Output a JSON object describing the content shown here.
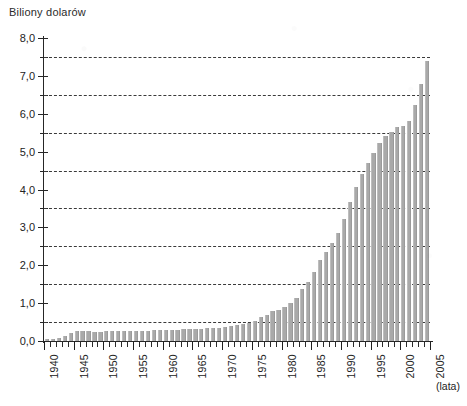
{
  "chart_data": {
    "type": "bar",
    "title": "",
    "ylabel": "Biliony dolarów",
    "xlabel": "(lata)",
    "ylim": [
      0.0,
      8.0
    ],
    "xlim": [
      1940,
      2005
    ],
    "grid": "horizontal dashed at half-unit values",
    "legend": "none",
    "bar_color": "#a9a9a9",
    "y_ticks_major": [
      "0,0",
      "1,0",
      "2,0",
      "3,0",
      "4,0",
      "5,0",
      "6,0",
      "7,0",
      "8,0"
    ],
    "y_tick_major_values": [
      0.0,
      1.0,
      2.0,
      3.0,
      4.0,
      5.0,
      6.0,
      7.0,
      8.0
    ],
    "y_tick_minor_values": [
      0.5,
      1.5,
      2.5,
      3.5,
      4.5,
      5.5,
      6.5,
      7.5
    ],
    "gridline_values": [
      0.5,
      1.5,
      2.5,
      3.5,
      4.5,
      5.5,
      6.5,
      7.5
    ],
    "x_ticks_major": [
      "1940",
      "1945",
      "1950",
      "1955",
      "1960",
      "1965",
      "1970",
      "1975",
      "1980",
      "1985",
      "1990",
      "1995",
      "2000",
      "2005"
    ],
    "x_tick_major_values": [
      1940,
      1945,
      1950,
      1955,
      1960,
      1965,
      1970,
      1975,
      1980,
      1985,
      1990,
      1995,
      2000,
      2005
    ],
    "categories": [
      1940,
      1941,
      1942,
      1943,
      1944,
      1945,
      1946,
      1947,
      1948,
      1949,
      1950,
      1951,
      1952,
      1953,
      1954,
      1955,
      1956,
      1957,
      1958,
      1959,
      1960,
      1961,
      1962,
      1963,
      1964,
      1965,
      1966,
      1967,
      1968,
      1969,
      1970,
      1971,
      1972,
      1973,
      1974,
      1975,
      1976,
      1977,
      1978,
      1979,
      1980,
      1981,
      1982,
      1983,
      1984,
      1985,
      1986,
      1987,
      1988,
      1989,
      1990,
      1991,
      1992,
      1993,
      1994,
      1995,
      1996,
      1997,
      1998,
      1999,
      2000,
      2001,
      2002,
      2003,
      2004
    ],
    "values": [
      0.05,
      0.06,
      0.08,
      0.14,
      0.2,
      0.26,
      0.27,
      0.26,
      0.25,
      0.25,
      0.26,
      0.26,
      0.26,
      0.27,
      0.27,
      0.27,
      0.27,
      0.27,
      0.28,
      0.29,
      0.29,
      0.29,
      0.3,
      0.31,
      0.32,
      0.32,
      0.33,
      0.34,
      0.35,
      0.35,
      0.37,
      0.4,
      0.43,
      0.46,
      0.48,
      0.54,
      0.63,
      0.7,
      0.78,
      0.83,
      0.91,
      1.0,
      1.14,
      1.37,
      1.56,
      1.82,
      2.13,
      2.35,
      2.6,
      2.86,
      3.23,
      3.67,
      4.06,
      4.41,
      4.69,
      4.97,
      5.22,
      5.41,
      5.53,
      5.66,
      5.67,
      5.81,
      6.23,
      6.78,
      7.38
    ]
  },
  "axes": {
    "y_caption": "Biliony dolarów",
    "x_unit": "(lata)"
  }
}
